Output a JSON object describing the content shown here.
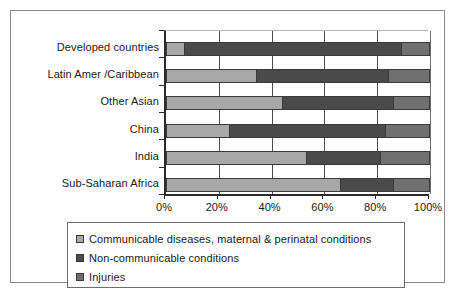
{
  "chart_data": {
    "type": "bar",
    "orientation": "horizontal",
    "stacked": true,
    "normalized": true,
    "title": "",
    "xlabel": "",
    "ylabel": "",
    "xlim": [
      0,
      100
    ],
    "xticks": [
      0,
      20,
      40,
      60,
      80,
      100
    ],
    "xtick_labels": [
      "0%",
      "20%",
      "40%",
      "60%",
      "80%",
      "100%"
    ],
    "grid": true,
    "legend_position": "bottom",
    "categories": [
      "Developed countries",
      "Latin Amer /Caribbean",
      "Other Asian",
      "China",
      "India",
      "Sub-Saharan Africa"
    ],
    "series": [
      {
        "name": "Communicable diseases, maternal & perinatal conditions",
        "color": "#a8a8a8",
        "values": [
          7,
          34,
          44,
          24,
          53,
          66
        ]
      },
      {
        "name": "Non-communicable conditions",
        "color": "#4a4a4a",
        "values": [
          82,
          50,
          42,
          59,
          28,
          20
        ]
      },
      {
        "name": "Injuries",
        "color": "#707070",
        "values": [
          11,
          16,
          14,
          17,
          19,
          14
        ]
      }
    ]
  },
  "legend": {
    "items": [
      {
        "label": "Communicable diseases, maternal & perinatal conditions",
        "color": "#a8a8a8"
      },
      {
        "label": "Non-communicable conditions",
        "color": "#4a4a4a"
      },
      {
        "label": "Injuries",
        "color": "#707070"
      }
    ]
  },
  "colors": {
    "communicable": "#a8a8a8",
    "non_communicable": "#4a4a4a",
    "injuries": "#707070",
    "axis": "#2b2b2b",
    "frame": "#8a8a8a"
  }
}
